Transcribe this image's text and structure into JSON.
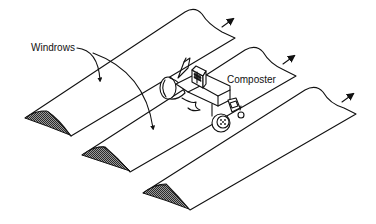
{
  "diagram": {
    "type": "illustration",
    "labels": {
      "windrows": "Windrows",
      "composter": "Composter"
    },
    "windrows": [
      {
        "id": 1,
        "label": "windrow-1",
        "has_direction_arrow": true
      },
      {
        "id": 2,
        "label": "windrow-2",
        "has_direction_arrow": true
      },
      {
        "id": 3,
        "label": "windrow-3",
        "has_direction_arrow": true
      }
    ],
    "colors": {
      "line": "#111111",
      "background": "#ffffff",
      "cross_section_fill": "#555555"
    }
  }
}
